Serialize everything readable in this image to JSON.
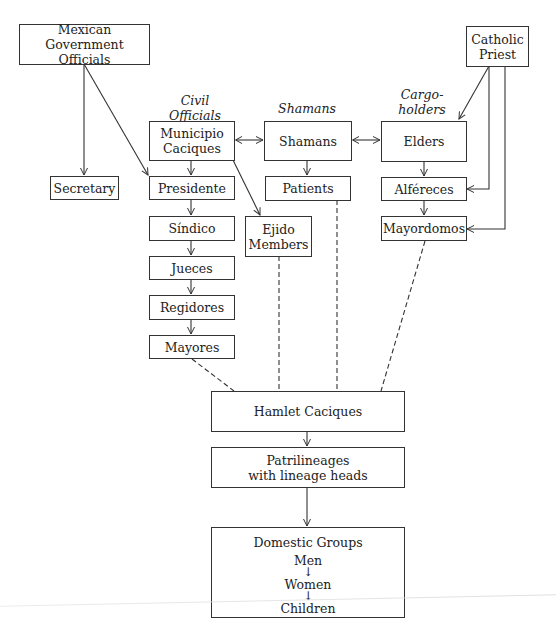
{
  "column_labels": {
    "civil": [
      "Civil",
      "Officials"
    ],
    "shamans": "Shamans",
    "cargo": [
      "Cargo-",
      "holders"
    ]
  },
  "nodes": {
    "mexican_gov": [
      "Mexican Government",
      "Officials"
    ],
    "catholic_priest": [
      "Catholic",
      "Priest"
    ],
    "municipio_caciques": [
      "Municipio",
      "Caciques"
    ],
    "shamans": "Shamans",
    "elders": "Elders",
    "secretary": "Secretary",
    "presidente": "Presidente",
    "patients": "Patients",
    "alfereces": "Alféreces",
    "sindico": "Síndico",
    "ejido_members": [
      "Ejido",
      "Members"
    ],
    "mayordomos": "Mayordomos",
    "jueces": "Jueces",
    "regidores": "Regidores",
    "mayores": "Mayores",
    "hamlet_caciques": "Hamlet Caciques",
    "patrilineages": [
      "Patrilineages",
      "with lineage heads"
    ],
    "domestic_groups": {
      "title": "Domestic Groups",
      "members": [
        "Men",
        "Women",
        "Children"
      ],
      "arrow": "↓"
    }
  },
  "edges": [
    {
      "from": "mexican_gov",
      "to": "secretary",
      "style": "solid-arrow"
    },
    {
      "from": "mexican_gov",
      "to": "presidente",
      "style": "solid-arrow"
    },
    {
      "from": "catholic_priest",
      "to": "elders",
      "style": "solid-arrow"
    },
    {
      "from": "catholic_priest",
      "to": "alfereces",
      "style": "solid-arrow"
    },
    {
      "from": "catholic_priest",
      "to": "mayordomos",
      "style": "solid-arrow"
    },
    {
      "from": "municipio_caciques",
      "to": "shamans",
      "style": "double-arrow"
    },
    {
      "from": "shamans",
      "to": "elders",
      "style": "double-arrow"
    },
    {
      "from": "municipio_caciques",
      "to": "presidente",
      "style": "solid-arrow"
    },
    {
      "from": "municipio_caciques",
      "to": "ejido_members",
      "style": "solid-arrow"
    },
    {
      "from": "presidente",
      "to": "sindico",
      "style": "solid-arrow"
    },
    {
      "from": "sindico",
      "to": "jueces",
      "style": "solid-arrow"
    },
    {
      "from": "jueces",
      "to": "regidores",
      "style": "solid-arrow"
    },
    {
      "from": "regidores",
      "to": "mayores",
      "style": "solid-arrow"
    },
    {
      "from": "shamans",
      "to": "patients",
      "style": "solid-arrow"
    },
    {
      "from": "elders",
      "to": "alfereces",
      "style": "solid-arrow"
    },
    {
      "from": "alfereces",
      "to": "mayordomos",
      "style": "solid-arrow"
    },
    {
      "from": "mayores",
      "to": "hamlet_caciques",
      "style": "dashed"
    },
    {
      "from": "ejido_members",
      "to": "hamlet_caciques",
      "style": "dashed"
    },
    {
      "from": "patients",
      "to": "hamlet_caciques",
      "style": "dashed"
    },
    {
      "from": "mayordomos",
      "to": "hamlet_caciques",
      "style": "dashed"
    },
    {
      "from": "hamlet_caciques",
      "to": "patrilineages",
      "style": "solid-arrow"
    },
    {
      "from": "patrilineages",
      "to": "domestic_groups",
      "style": "solid-arrow"
    }
  ]
}
